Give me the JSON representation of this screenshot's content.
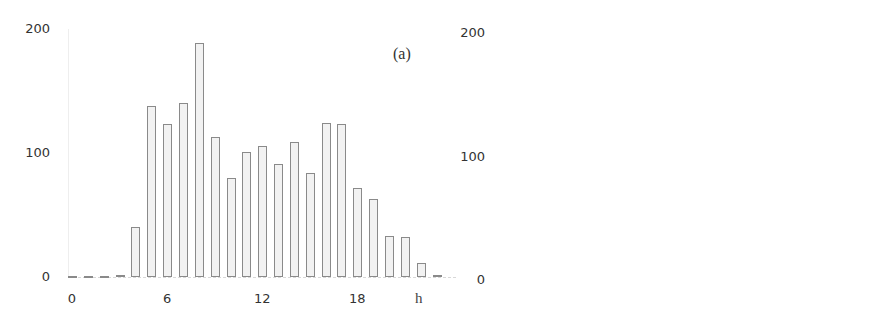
{
  "chart_data": [
    {
      "type": "bar",
      "title": "",
      "panel_label": "(a)",
      "xlabel": "h",
      "ylabel": "",
      "ylim": [
        0,
        200
      ],
      "yticks": [
        "0",
        "100",
        "200"
      ],
      "xticks": [
        "0",
        "6",
        "12",
        "18"
      ],
      "categories": [
        0,
        1,
        2,
        3,
        4,
        5,
        6,
        7,
        8,
        9,
        10,
        11,
        12,
        13,
        14,
        15,
        16,
        17,
        18,
        19,
        20,
        21,
        22,
        23
      ],
      "values": [
        1,
        0,
        0,
        2,
        40,
        138,
        123,
        140,
        189,
        113,
        80,
        101,
        106,
        91,
        109,
        84,
        124,
        123,
        72,
        63,
        33,
        32,
        11,
        2
      ],
      "grid": false,
      "legend": "none"
    },
    {
      "type": "bar",
      "title": "",
      "panel_label": "(b)",
      "xlabel": "h",
      "ylabel": "",
      "ylim": [
        0,
        200
      ],
      "yticks": [
        "0",
        "100",
        "200"
      ],
      "xticks": [
        "0",
        "6",
        "12",
        "18"
      ],
      "categories": [
        0,
        1,
        2,
        3,
        4,
        5,
        6,
        7,
        8,
        9,
        10,
        11,
        12,
        13,
        14,
        15,
        16,
        17,
        18,
        19,
        20,
        21,
        22,
        23
      ],
      "values": [
        0,
        0,
        0,
        1,
        3,
        20,
        171,
        159,
        58,
        4,
        6,
        37,
        102,
        14,
        13,
        9,
        11,
        80,
        106,
        45,
        20,
        4,
        1,
        1
      ],
      "grid": false,
      "legend": "none"
    }
  ],
  "layout": [
    {
      "left": 0,
      "y0": 277,
      "y200": 29,
      "x0": 72,
      "step": 15.85,
      "ylabel_x": 10,
      "panel_x": 393,
      "panel_y": 45,
      "h_x": 415,
      "h_y": 290,
      "xtick_y": 292,
      "axis_x": 68
    },
    {
      "left": 445,
      "y0": 280,
      "y200": 33,
      "x0": 499,
      "step": 15.6,
      "ylabel_x": 0,
      "panel_x": 828,
      "panel_y": 48,
      "h_x": 845,
      "h_y": 298,
      "xtick_y": 295,
      "axis_x": 493
    }
  ]
}
